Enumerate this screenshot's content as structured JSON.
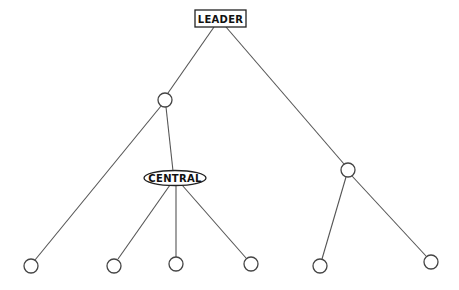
{
  "diagram": {
    "type": "tree",
    "colors": {
      "stroke": "#444444",
      "background": "#ffffff",
      "text": "#111111"
    },
    "nodes": [
      {
        "id": "leader",
        "label": "LEADER",
        "shape": "rectangle",
        "x": 220,
        "y": 18
      },
      {
        "id": "n1",
        "label": "",
        "shape": "circle",
        "x": 165,
        "y": 100
      },
      {
        "id": "central",
        "label": "CENTRAL",
        "shape": "ellipse",
        "x": 175,
        "y": 178
      },
      {
        "id": "n2",
        "label": "",
        "shape": "circle",
        "x": 348,
        "y": 170
      },
      {
        "id": "l1",
        "label": "",
        "shape": "circle",
        "x": 31,
        "y": 266
      },
      {
        "id": "l2",
        "label": "",
        "shape": "circle",
        "x": 114,
        "y": 266
      },
      {
        "id": "l3",
        "label": "",
        "shape": "circle",
        "x": 176,
        "y": 264
      },
      {
        "id": "l4",
        "label": "",
        "shape": "circle",
        "x": 251,
        "y": 264
      },
      {
        "id": "l5",
        "label": "",
        "shape": "circle",
        "x": 320,
        "y": 266
      },
      {
        "id": "l6",
        "label": "",
        "shape": "circle",
        "x": 431,
        "y": 262
      }
    ],
    "edges": [
      [
        "leader",
        "n1"
      ],
      [
        "leader",
        "n2"
      ],
      [
        "n1",
        "l1"
      ],
      [
        "n1",
        "central"
      ],
      [
        "central",
        "l2"
      ],
      [
        "central",
        "l3"
      ],
      [
        "central",
        "l4"
      ],
      [
        "n2",
        "l5"
      ],
      [
        "n2",
        "l6"
      ]
    ],
    "labels": {
      "leader": "LEADER",
      "central": "CENTRAL"
    }
  }
}
